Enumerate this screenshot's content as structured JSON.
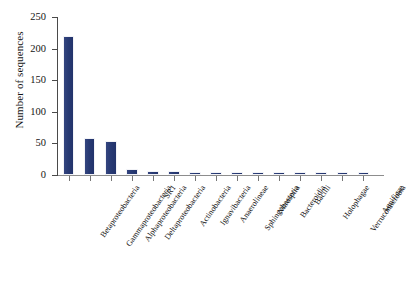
{
  "chart_data": {
    "type": "bar",
    "title": "",
    "xlabel": "",
    "ylabel": "Number of sequences",
    "ylim": [
      0,
      250
    ],
    "yticks": [
      0,
      50,
      100,
      150,
      200,
      250
    ],
    "grid": false,
    "legend": "none",
    "bar_color": "#2c3c77",
    "categories": [
      "Betaproteobacteria",
      "Gammaproteobacteria",
      "Alphaproteobacteria",
      "Deltaproteobacteria",
      "SR1",
      "Actinobacteria",
      "Ignavibacteria",
      "Anaerolineae",
      "Sphingobacteria",
      "Nitrospira",
      "Bacteroidia",
      "Bacilli",
      "Holophagae",
      "Verrucomicrobia",
      "Aquificae"
    ],
    "values": [
      220,
      59,
      54,
      9,
      6,
      6,
      5,
      5,
      5,
      5,
      5,
      5,
      5,
      4,
      4
    ]
  },
  "axes": {
    "y_axis_title": "Number of sequences",
    "y_tick_labels": [
      "0",
      "50",
      "100",
      "150",
      "200",
      "250"
    ]
  }
}
